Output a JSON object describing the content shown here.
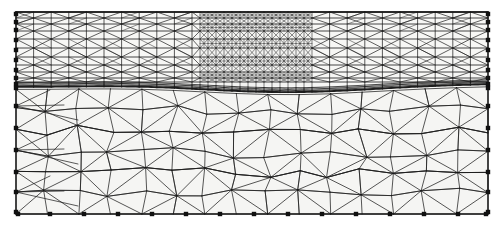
{
  "figure": {
    "kind": "finite-element-mesh-plot",
    "title": "",
    "background_color": "#ffffff",
    "line_color": "#1a1a1a",
    "node_marker_color": "#111111",
    "domain_extent_px": {
      "x0": 16,
      "y0": 12,
      "x1": 488,
      "y1": 214
    },
    "regions": [
      {
        "name": "upper-layered-region",
        "fill_color": "#f7f7f5",
        "y_top": 12,
        "y_bottom": 88,
        "description": "thin stratified layers, horizontal interfaces, dense triangulation"
      },
      {
        "name": "curved-material-interface",
        "fill_color": "#e8e8e6",
        "y_nominal": 88,
        "description": "heavy dark curved interface band spanning full width"
      },
      {
        "name": "lower-coarse-region",
        "fill_color": "#f5f5f3",
        "y_top": 90,
        "y_bottom": 214,
        "description": "coarse unstructured triangular mesh"
      },
      {
        "name": "local-refinement-zone",
        "fill_color": "#f2f2f0",
        "x_left": 200,
        "x_right": 312,
        "y_top": 14,
        "y_bottom": 88,
        "description": "locally refined high density sub-mesh in upper middle"
      }
    ],
    "boundaries": [
      {
        "name": "top-boundary",
        "marked": false
      },
      {
        "name": "left-boundary",
        "marked": true
      },
      {
        "name": "right-boundary",
        "marked": true
      },
      {
        "name": "bottom-boundary",
        "marked": true
      }
    ],
    "node_markers": {
      "shape": "square",
      "size_px": 4,
      "bottom_y": 214,
      "bottom_x": [
        18,
        50,
        84,
        118,
        152,
        186,
        220,
        254,
        288,
        322,
        356,
        390,
        424,
        458,
        486
      ],
      "left_x": 16,
      "left_y": [
        14,
        22,
        30,
        40,
        50,
        60,
        70,
        78,
        84,
        88,
        106,
        128,
        150,
        172,
        192,
        212
      ],
      "right_x": 488,
      "right_y": [
        14,
        22,
        30,
        40,
        50,
        60,
        70,
        78,
        84,
        88,
        106,
        128,
        150,
        172,
        192,
        212
      ]
    }
  }
}
